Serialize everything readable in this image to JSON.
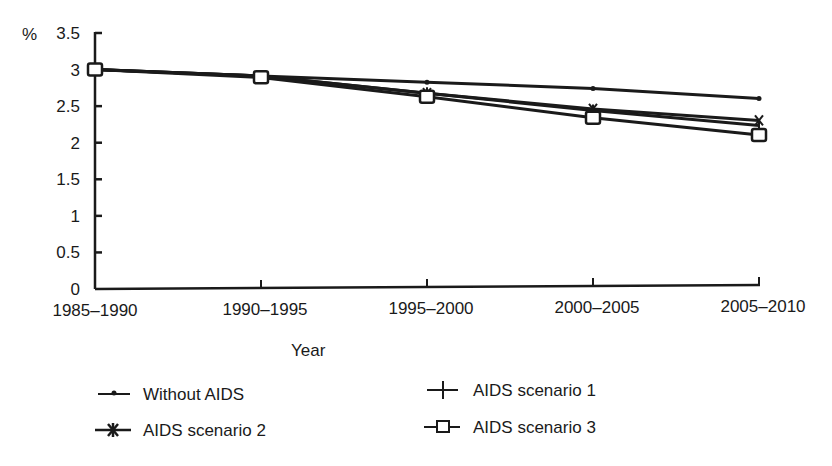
{
  "chart_data": {
    "type": "line",
    "title": "",
    "xlabel": "Year",
    "ylabel": "%",
    "ylim": [
      0,
      3.5
    ],
    "yticks": [
      0,
      0.5,
      1,
      1.5,
      2,
      2.5,
      3,
      3.5
    ],
    "ytick_labels": [
      "0",
      "0.5",
      "1",
      "1.5",
      "2",
      "2.5",
      "3",
      "3.5"
    ],
    "categories": [
      "1985–1990",
      "1990–1995",
      "1995–2000",
      "2000–2005",
      "2005–2010"
    ],
    "grid": false,
    "legend_position": "bottom",
    "series": [
      {
        "name": "Without AIDS",
        "marker": "dot",
        "values": [
          3.0,
          2.9,
          2.8,
          2.7,
          2.55
        ]
      },
      {
        "name": "AIDS scenario 1",
        "marker": "plus",
        "values": [
          3.0,
          2.9,
          2.65,
          2.4,
          2.18
        ]
      },
      {
        "name": "AIDS scenario 2",
        "marker": "star",
        "values": [
          3.0,
          2.9,
          2.65,
          2.42,
          2.25
        ]
      },
      {
        "name": "AIDS scenario 3",
        "marker": "square",
        "values": [
          3.0,
          2.88,
          2.6,
          2.3,
          2.05
        ]
      }
    ]
  },
  "axis": {
    "y_unit": "%",
    "x_title": "Year"
  },
  "legend": {
    "items": [
      {
        "label": "Without AIDS",
        "marker": "dot-icon"
      },
      {
        "label": "AIDS scenario 1",
        "marker": "plus-icon"
      },
      {
        "label": "AIDS scenario 2",
        "marker": "star-icon"
      },
      {
        "label": "AIDS scenario 3",
        "marker": "square-icon"
      }
    ]
  },
  "colors": {
    "ink": "#1a1a1a",
    "background": "#ffffff"
  }
}
